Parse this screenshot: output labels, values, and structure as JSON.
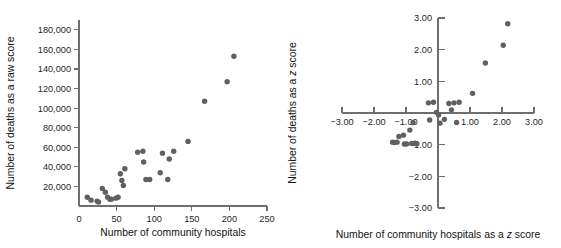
{
  "figure": {
    "background": "#ffffff",
    "point_color": "#606060",
    "axis_color": "#6e6e6e"
  },
  "chart_data": [
    {
      "id": "raw-score-scatter",
      "type": "scatter",
      "title": "",
      "xlabel": "Number of community hospitals",
      "ylabel": "Number of deaths as a raw score",
      "xlim": [
        0,
        250
      ],
      "ylim": [
        0,
        190000
      ],
      "xticks": [
        0,
        50,
        100,
        150,
        200,
        250
      ],
      "xticklabels": [
        "0",
        "50",
        "100",
        "150",
        "200",
        "250"
      ],
      "yticks": [
        20000,
        40000,
        60000,
        80000,
        100000,
        120000,
        140000,
        160000,
        180000
      ],
      "yticklabels": [
        "20,000",
        "40,000",
        "60,000",
        "80,000",
        "100,000",
        "120,000",
        "140,000",
        "160,000",
        "180,000"
      ],
      "grid": false,
      "legend": false,
      "x": [
        11,
        16,
        24,
        26,
        31,
        35,
        38,
        41,
        43,
        49,
        52,
        55,
        57,
        59,
        61,
        78,
        85,
        86,
        89,
        94,
        108,
        111,
        118,
        120,
        126,
        145,
        167,
        197,
        206
      ],
      "y": [
        9000,
        6000,
        5000,
        4000,
        18000,
        14000,
        9000,
        7000,
        7000,
        8000,
        9000,
        33000,
        26000,
        21000,
        38000,
        55000,
        56000,
        45000,
        27000,
        27000,
        34000,
        54000,
        27000,
        48000,
        56000,
        66000,
        107000,
        127000,
        153000
      ]
    },
    {
      "id": "z-score-scatter",
      "type": "scatter",
      "title": "",
      "xlabel": "Number of community hospitals as a z score",
      "ylabel": "Number of deaths as a z score",
      "xlim": [
        -3.0,
        3.0
      ],
      "ylim": [
        -3.0,
        3.0
      ],
      "xticks": [
        -3.0,
        -2.0,
        -1.0,
        0.0,
        1.0,
        2.0,
        3.0
      ],
      "xticklabels": [
        "−3.00",
        "−2.00",
        "−1.00",
        "",
        "1.00",
        "2.00",
        "3.00"
      ],
      "yticks": [
        -3.0,
        -2.0,
        -1.0,
        0.0,
        1.0,
        2.0,
        3.0
      ],
      "yticklabels": [
        "−3.00",
        "−2.00",
        "−1.00",
        "",
        "1.00",
        "2.00",
        "3.00"
      ],
      "grid": false,
      "legend": false,
      "x": [
        -1.42,
        -1.36,
        -1.28,
        -1.22,
        -1.08,
        -1.05,
        -0.98,
        -0.88,
        -0.82,
        -0.78,
        -0.72,
        -0.7,
        -0.66,
        -0.3,
        -0.26,
        -0.14,
        -0.05,
        0.02,
        0.06,
        0.2,
        0.34,
        0.42,
        0.5,
        0.58,
        0.66,
        1.08,
        1.48,
        2.04,
        2.18
      ],
      "y": [
        -0.92,
        -0.93,
        -0.92,
        -0.74,
        -0.7,
        -0.98,
        -0.98,
        -0.54,
        -0.96,
        -0.3,
        -0.95,
        -0.96,
        -0.97,
        0.32,
        -0.22,
        0.34,
        0.02,
        -0.06,
        -0.32,
        -0.2,
        0.3,
        0.1,
        0.32,
        -0.3,
        0.34,
        0.62,
        1.58,
        2.14,
        2.82
      ]
    }
  ]
}
